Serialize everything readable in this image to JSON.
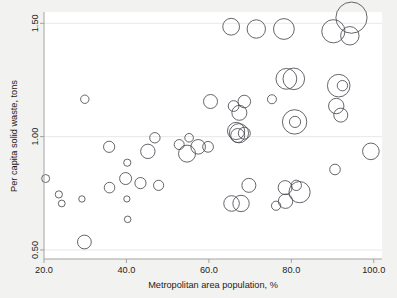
{
  "chart_data": {
    "type": "scatter",
    "title": "",
    "subtitle": "",
    "xlabel": "Metropolitan area population, %",
    "ylabel": "Per capita solid waste, tons",
    "xlim": [
      20.0,
      102.0
    ],
    "ylim": [
      0.46,
      1.55
    ],
    "xticks": [
      "20.0",
      "40.0",
      "60.0",
      "80.0",
      "100.0"
    ],
    "xtick_values": [
      20.0,
      40.0,
      60.0,
      80.0,
      100.0
    ],
    "yticks": [
      "0.50",
      "1.00",
      "1.50"
    ],
    "ytick_values": [
      0.5,
      1.0,
      1.5
    ],
    "grid": "horizontal",
    "legend": "none",
    "marker": "open-circle",
    "size_encoding": "bubble area proportional to weight",
    "series": [
      {
        "name": "metro areas",
        "points": [
          {
            "x": 20.4,
            "y": 0.815,
            "s": 4.0
          },
          {
            "x": 23.6,
            "y": 0.745,
            "s": 3.6
          },
          {
            "x": 24.3,
            "y": 0.705,
            "s": 3.4
          },
          {
            "x": 29.2,
            "y": 0.725,
            "s": 3.2
          },
          {
            "x": 29.9,
            "y": 1.165,
            "s": 4.2
          },
          {
            "x": 29.8,
            "y": 0.535,
            "s": 6.9
          },
          {
            "x": 35.8,
            "y": 0.955,
            "s": 5.6
          },
          {
            "x": 35.9,
            "y": 0.775,
            "s": 5.3
          },
          {
            "x": 39.8,
            "y": 0.815,
            "s": 6.0
          },
          {
            "x": 40.2,
            "y": 0.885,
            "s": 3.6
          },
          {
            "x": 40.3,
            "y": 0.635,
            "s": 3.3
          },
          {
            "x": 40.1,
            "y": 0.725,
            "s": 3.1
          },
          {
            "x": 43.4,
            "y": 0.795,
            "s": 5.6
          },
          {
            "x": 45.2,
            "y": 0.935,
            "s": 7.2
          },
          {
            "x": 46.9,
            "y": 0.995,
            "s": 5.2
          },
          {
            "x": 47.8,
            "y": 0.785,
            "s": 5.1
          },
          {
            "x": 52.8,
            "y": 0.965,
            "s": 5.0
          },
          {
            "x": 55.2,
            "y": 0.995,
            "s": 4.3
          },
          {
            "x": 54.7,
            "y": 0.925,
            "s": 8.5
          },
          {
            "x": 57.4,
            "y": 0.955,
            "s": 7.3
          },
          {
            "x": 59.8,
            "y": 0.955,
            "s": 5.4
          },
          {
            "x": 60.4,
            "y": 1.155,
            "s": 7.0
          },
          {
            "x": 65.4,
            "y": 1.485,
            "s": 8.4
          },
          {
            "x": 66.0,
            "y": 1.135,
            "s": 5.4
          },
          {
            "x": 67.4,
            "y": 1.105,
            "s": 7.5
          },
          {
            "x": 68.6,
            "y": 1.155,
            "s": 6.3
          },
          {
            "x": 66.6,
            "y": 1.025,
            "s": 8.6
          },
          {
            "x": 67.3,
            "y": 1.015,
            "s": 9.6
          },
          {
            "x": 67.0,
            "y": 1.005,
            "s": 7.0
          },
          {
            "x": 68.6,
            "y": 1.015,
            "s": 6.0
          },
          {
            "x": 65.5,
            "y": 0.705,
            "s": 7.8
          },
          {
            "x": 67.8,
            "y": 0.705,
            "s": 8.2
          },
          {
            "x": 69.7,
            "y": 0.785,
            "s": 7.0
          },
          {
            "x": 71.5,
            "y": 1.475,
            "s": 9.2
          },
          {
            "x": 75.3,
            "y": 1.165,
            "s": 4.5
          },
          {
            "x": 76.3,
            "y": 0.695,
            "s": 4.6
          },
          {
            "x": 78.2,
            "y": 1.475,
            "s": 10.4
          },
          {
            "x": 78.8,
            "y": 1.255,
            "s": 10.4
          },
          {
            "x": 78.5,
            "y": 0.775,
            "s": 7.0
          },
          {
            "x": 78.6,
            "y": 0.715,
            "s": 7.2
          },
          {
            "x": 80.6,
            "y": 1.255,
            "s": 10.8
          },
          {
            "x": 80.8,
            "y": 1.065,
            "s": 12.2
          },
          {
            "x": 80.9,
            "y": 1.065,
            "s": 5.6
          },
          {
            "x": 81.2,
            "y": 0.785,
            "s": 5.2
          },
          {
            "x": 82.0,
            "y": 0.755,
            "s": 10.6
          },
          {
            "x": 90.2,
            "y": 1.465,
            "s": 11.6
          },
          {
            "x": 91.5,
            "y": 1.225,
            "s": 11.3
          },
          {
            "x": 92.4,
            "y": 1.225,
            "s": 5.2
          },
          {
            "x": 90.9,
            "y": 1.135,
            "s": 7.7
          },
          {
            "x": 92.0,
            "y": 1.095,
            "s": 7.0
          },
          {
            "x": 90.6,
            "y": 0.855,
            "s": 5.3
          },
          {
            "x": 94.6,
            "y": 1.525,
            "s": 15.6
          },
          {
            "x": 94.2,
            "y": 1.445,
            "s": 9.2
          },
          {
            "x": 99.3,
            "y": 0.935,
            "s": 8.3
          }
        ]
      }
    ]
  },
  "axes": {
    "x_label": "Metropolitan area population, %",
    "y_label": "Per capita solid waste, tons",
    "x_tick_labels": [
      "20.0",
      "40.0",
      "60.0",
      "80.0",
      "100.0"
    ],
    "y_tick_labels": [
      "0.50",
      "1.00",
      "1.50"
    ]
  },
  "colors": {
    "page_background": "#f2f2f0",
    "plot_background": "#ffffff",
    "bubble_stroke": "#4a4a52",
    "gridline": "#e2e2e0",
    "axis_line": "#9a9a9a",
    "text": "#1c1c1c"
  }
}
